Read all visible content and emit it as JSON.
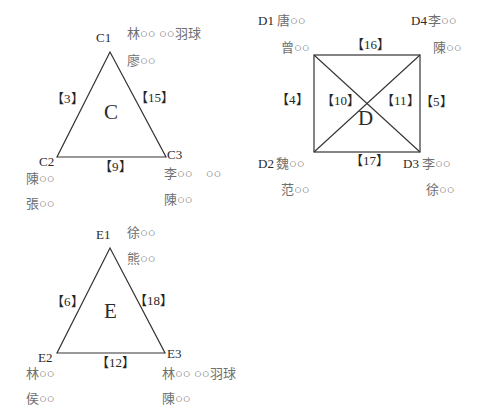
{
  "colors": {
    "background": "#ffffff",
    "line": "#333333",
    "label_ink": "#2b2b2b",
    "name_ink": "#6f6f6f"
  },
  "diagram": {
    "groups": [
      {
        "id": "C",
        "type": "triangle",
        "center": "C",
        "edges": {
          "left": "【3】",
          "right": "【15】",
          "bottom": "【9】"
        },
        "vertices": {
          "top": {
            "label": "C1",
            "line1": "林○○ ○○羽球",
            "line2": "廖○○"
          },
          "left": {
            "label": "C2",
            "line1": "陳○○",
            "line2": "張○○"
          },
          "right": {
            "label": "C3",
            "line1": "李○○　○○",
            "line2": "陳○○"
          }
        }
      },
      {
        "id": "D",
        "type": "square_with_diagonals",
        "center": "D",
        "edges": {
          "top": "【16】",
          "left": "【4】",
          "right": "【5】",
          "bottom": "【17】",
          "diag_left": "【10】",
          "diag_right": "【11】"
        },
        "vertices": {
          "top_left": {
            "label": "D1",
            "line1": "唐○○",
            "line2": "曾○○"
          },
          "top_right": {
            "label": "D4",
            "line1": "李○○",
            "line2": "陳○○"
          },
          "bottom_left": {
            "label": "D2",
            "line1": "魏○○",
            "line2": "范○○"
          },
          "bottom_right": {
            "label": "D3",
            "line1": "李○○",
            "line2": "徐○○"
          }
        }
      },
      {
        "id": "E",
        "type": "triangle",
        "center": "E",
        "edges": {
          "left": "【6】",
          "right": "【18】",
          "bottom": "【12】"
        },
        "vertices": {
          "top": {
            "label": "E1",
            "line1": "徐○○",
            "line2": "熊○○"
          },
          "left": {
            "label": "E2",
            "line1": "林○○",
            "line2": "侯○○"
          },
          "right": {
            "label": "E3",
            "line1": "林○○ ○○羽球",
            "line2": "陳○○"
          }
        }
      }
    ]
  }
}
